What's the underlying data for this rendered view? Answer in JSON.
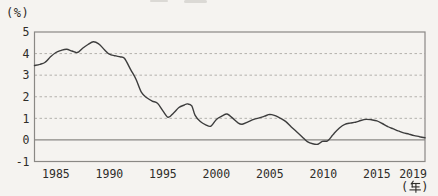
{
  "figure": {
    "y_unit": "(%)",
    "x_unit": "(年)"
  },
  "colors": {
    "line": "#3d3d3d",
    "frame": "#8a8885",
    "grid": "#b3b1ac",
    "zero_line": "#8a8885",
    "text": "#2e2c29",
    "background": "#f5f3f0"
  },
  "chart_data": {
    "type": "line",
    "title": "",
    "xlabel": "(年)",
    "ylabel": "(%)",
    "xlim": [
      1983,
      2019.5
    ],
    "ylim": [
      -1,
      5
    ],
    "x_ticks": [
      1985,
      1990,
      1995,
      2000,
      2005,
      2010,
      2015,
      2019
    ],
    "y_ticks": [
      5,
      4,
      3,
      2,
      1,
      0,
      -1
    ],
    "dashed_gridlines": [
      1,
      2,
      3,
      4
    ],
    "zero_line": "solid",
    "legend": "none",
    "series": [
      {
        "name": "rate",
        "x": [
          1983,
          1983.5,
          1984,
          1984.5,
          1985,
          1985.5,
          1986,
          1986.5,
          1987,
          1987.5,
          1988,
          1988.5,
          1989,
          1989.5,
          1990,
          1990.5,
          1991,
          1991.4,
          1992,
          1992.5,
          1993,
          1993.5,
          1994,
          1994.5,
          1995,
          1995.5,
          1996,
          1996.5,
          1997,
          1997.3,
          1997.7,
          1998,
          1998.5,
          1999,
          1999.5,
          2000,
          2000.5,
          2001,
          2001.5,
          2002,
          2002.4,
          2003,
          2003.5,
          2004,
          2004.5,
          2005,
          2005.5,
          2006,
          2006.5,
          2007,
          2007.5,
          2008,
          2008.5,
          2009,
          2009.5,
          2009.9,
          2010.4,
          2010.8,
          2011,
          2011.5,
          2012,
          2012.5,
          2013,
          2013.5,
          2014,
          2014.5,
          2015,
          2015.5,
          2016,
          2016.5,
          2017,
          2017.5,
          2018,
          2018.5,
          2019,
          2019.5
        ],
        "y": [
          3.45,
          3.5,
          3.6,
          3.85,
          4.05,
          4.15,
          4.2,
          4.12,
          4.05,
          4.25,
          4.42,
          4.55,
          4.45,
          4.2,
          3.97,
          3.9,
          3.85,
          3.78,
          3.25,
          2.8,
          2.2,
          1.95,
          1.8,
          1.7,
          1.35,
          1.05,
          1.25,
          1.5,
          1.62,
          1.67,
          1.58,
          1.15,
          0.85,
          0.7,
          0.64,
          0.95,
          1.1,
          1.2,
          1.02,
          0.8,
          0.73,
          0.85,
          0.95,
          1.02,
          1.1,
          1.18,
          1.12,
          1.0,
          0.85,
          0.6,
          0.38,
          0.15,
          -0.08,
          -0.18,
          -0.2,
          -0.07,
          -0.04,
          0.18,
          0.3,
          0.55,
          0.72,
          0.78,
          0.82,
          0.9,
          0.95,
          0.93,
          0.88,
          0.76,
          0.62,
          0.52,
          0.42,
          0.33,
          0.27,
          0.2,
          0.15,
          0.1
        ]
      }
    ]
  }
}
